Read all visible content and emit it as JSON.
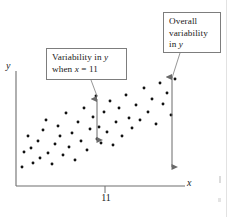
{
  "figure": {
    "type": "scatter-plot-annotated",
    "axes": {
      "y_label": "y",
      "x_label": "x",
      "x_tick_label": "11"
    },
    "callouts": {
      "conditional": {
        "line1_prefix": "Variability in ",
        "line1_italic": "y",
        "line2_prefix": "when ",
        "line2_italic": "x",
        "line2_suffix": " = 11"
      },
      "overall": {
        "line1": "Overall",
        "line2": "variability",
        "line3_prefix": "in ",
        "line3_italic": "y"
      }
    },
    "colors": {
      "ink": "#1a1a1a",
      "axis": "#6e6e6e",
      "box_border": "#7d7d7d",
      "point": "#111111",
      "arrow": "#6a6a6a",
      "leader": "#8a8a8a"
    }
  },
  "chart_data": {
    "type": "scatter",
    "title": "",
    "xlabel": "x",
    "ylabel": "y",
    "grid": false,
    "legend": null,
    "axis_style": "L-shaped open axes, no numeric scale",
    "x_ticks": [
      {
        "label": "11",
        "px": 105
      }
    ],
    "points_px": [
      [
        22,
        167
      ],
      [
        24,
        152
      ],
      [
        28,
        136
      ],
      [
        31,
        148
      ],
      [
        33,
        163
      ],
      [
        38,
        141
      ],
      [
        40,
        158
      ],
      [
        43,
        130
      ],
      [
        46,
        120
      ],
      [
        48,
        153
      ],
      [
        52,
        164
      ],
      [
        55,
        144
      ],
      [
        58,
        126
      ],
      [
        60,
        136
      ],
      [
        63,
        155
      ],
      [
        66,
        113
      ],
      [
        69,
        147
      ],
      [
        72,
        133
      ],
      [
        75,
        160
      ],
      [
        78,
        122
      ],
      [
        81,
        141
      ],
      [
        84,
        108
      ],
      [
        87,
        150
      ],
      [
        90,
        129
      ],
      [
        93,
        117
      ],
      [
        96,
        96
      ],
      [
        97,
        139
      ],
      [
        99,
        127
      ],
      [
        101,
        143
      ],
      [
        104,
        112
      ],
      [
        107,
        132
      ],
      [
        110,
        101
      ],
      [
        113,
        145
      ],
      [
        116,
        122
      ],
      [
        119,
        108
      ],
      [
        122,
        136
      ],
      [
        126,
        95
      ],
      [
        129,
        118
      ],
      [
        132,
        128
      ],
      [
        136,
        105
      ],
      [
        140,
        120
      ],
      [
        144,
        88
      ],
      [
        148,
        112
      ],
      [
        152,
        99
      ],
      [
        156,
        124
      ],
      [
        160,
        83
      ],
      [
        163,
        104
      ],
      [
        167,
        93
      ],
      [
        171,
        115
      ],
      [
        175,
        79
      ]
    ],
    "annotations": [
      {
        "name": "conditional-variability-arrow",
        "kind": "double-headed-vertical-arrow",
        "x_px": 97,
        "y_top_px": 96,
        "y_bottom_px": 143,
        "label": "Variability in y when x = 11"
      },
      {
        "name": "overall-variability-arrow",
        "kind": "double-headed-vertical-arrow",
        "x_px": 172,
        "y_top_px": 74,
        "y_bottom_px": 170,
        "label": "Overall variability in y"
      }
    ]
  }
}
